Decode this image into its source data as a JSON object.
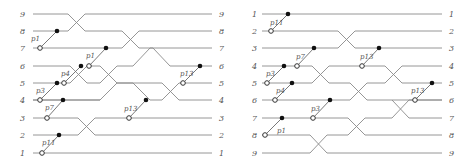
{
  "colors": {
    "wire": "#8a8a8a",
    "connector": "#6a6a6a",
    "filled_dot": "#111111",
    "open_dot_stroke": "#333333",
    "text": "#555555"
  },
  "panels": [
    {
      "name": "left-network",
      "left_labels": [
        "9",
        "8",
        "7",
        "6",
        "5",
        "4",
        "3",
        "2",
        "1"
      ],
      "right_labels": [
        "9",
        "8",
        "7",
        "6",
        "5",
        "4",
        "3",
        "2",
        "1"
      ],
      "connectors": [
        {
          "label": "p1",
          "from": "7",
          "to": "8"
        },
        {
          "label": "p1",
          "from": "6",
          "to": "7"
        },
        {
          "label": "p4",
          "from": "5",
          "to": "6"
        },
        {
          "label": "p3",
          "from": "4",
          "to": "5"
        },
        {
          "label": "p7",
          "from": "3",
          "to": "4"
        },
        {
          "label": "p11",
          "from": "1",
          "to": "2"
        },
        {
          "label": "p13",
          "from": "3",
          "to": "4"
        },
        {
          "label": "p13",
          "from": "5",
          "to": "6"
        }
      ]
    },
    {
      "name": "right-network",
      "left_labels": [
        "1",
        "2",
        "3",
        "4",
        "5",
        "6",
        "7",
        "8",
        "9"
      ],
      "right_labels": [
        "1",
        "2",
        "3",
        "4",
        "5",
        "6",
        "7",
        "8",
        "9"
      ],
      "connectors": [
        {
          "label": "p11",
          "from": "2",
          "to": "1"
        },
        {
          "label": "p7",
          "from": "4",
          "to": "3"
        },
        {
          "label": "p3",
          "from": "5",
          "to": "4"
        },
        {
          "label": "p4",
          "from": "6",
          "to": "5"
        },
        {
          "label": "p3",
          "from": "7",
          "to": "6"
        },
        {
          "label": "p1",
          "from": "8",
          "to": "7"
        },
        {
          "label": "p13",
          "from": "4",
          "to": "3"
        },
        {
          "label": "p13",
          "from": "6",
          "to": "5"
        }
      ]
    }
  ]
}
